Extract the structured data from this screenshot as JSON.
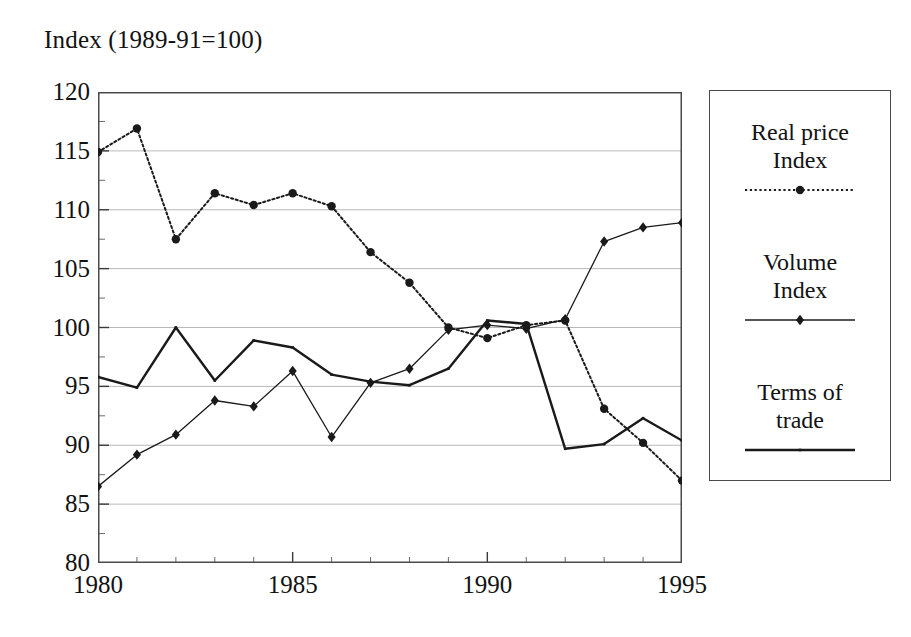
{
  "chart_data": {
    "type": "line",
    "title": "Index (1989-91=100)",
    "xlabel": "",
    "ylabel": "Index (1989-91=100)",
    "xlim": [
      1980,
      1995
    ],
    "ylim": [
      80,
      120
    ],
    "ytick_step": 5,
    "grid": "horizontal",
    "legend_position": "right",
    "x": [
      1980,
      1981,
      1982,
      1983,
      1984,
      1985,
      1986,
      1987,
      1988,
      1989,
      1990,
      1991,
      1992,
      1993,
      1994,
      1995
    ],
    "xticks": [
      1980,
      1985,
      1990,
      1995
    ],
    "yticks": [
      80,
      85,
      90,
      95,
      100,
      105,
      110,
      115,
      120
    ],
    "series": [
      {
        "name": "Real price Index",
        "style": "dotted",
        "marker": "circle",
        "color": "#1a1a1a",
        "values": [
          114.9,
          116.9,
          107.5,
          111.4,
          110.4,
          111.4,
          110.3,
          106.4,
          103.8,
          100.0,
          99.1,
          100.2,
          100.6,
          93.1,
          90.2,
          87.0
        ]
      },
      {
        "name": "Volume Index",
        "style": "thin-solid",
        "marker": "diamond",
        "color": "#1a1a1a",
        "values": [
          86.5,
          89.2,
          90.9,
          93.8,
          93.3,
          96.3,
          90.7,
          95.3,
          96.5,
          99.8,
          100.2,
          99.9,
          100.7,
          107.3,
          108.5,
          108.9
        ]
      },
      {
        "name": "Terms of trade",
        "style": "solid",
        "marker": "none",
        "color": "#1a1a1a",
        "values": [
          95.8,
          94.9,
          100.0,
          95.5,
          98.9,
          98.3,
          96.0,
          95.4,
          95.1,
          96.5,
          100.6,
          100.3,
          89.7,
          90.1,
          92.3,
          90.4
        ]
      }
    ]
  },
  "legend": {
    "entries": [
      {
        "label_line1": "Real price",
        "label_line2": "Index",
        "sample": "dotted-circle-line"
      },
      {
        "label_line1": "Volume",
        "label_line2": "Index",
        "sample": "thin-diamond-line"
      },
      {
        "label_line1": "Terms of",
        "label_line2": "trade",
        "sample": "solid-line"
      }
    ]
  }
}
